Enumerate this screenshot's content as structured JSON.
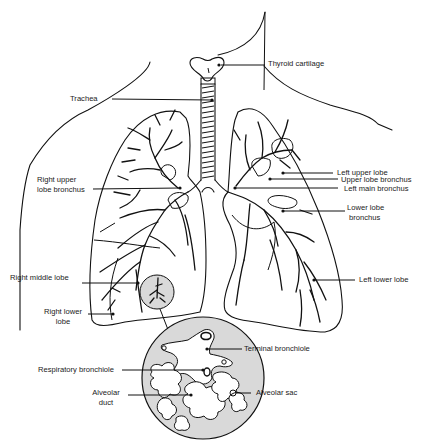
{
  "figure": {
    "type": "anatomical-line-drawing",
    "colors": {
      "ink": "#111111",
      "background": "#ffffff",
      "inset_fill": "#d9d9d9"
    }
  },
  "labels": {
    "thyroid_cartilage": "Thyroid cartilage",
    "trachea": "Trachea",
    "right_upper_lobe_bronchus_1": "Right upper",
    "right_upper_lobe_bronchus_2": "lobe bronchus",
    "left_upper_lobe": "Left upper lobe",
    "upper_lobe_bronchus": "Upper lobe bronchus",
    "left_main_bronchus": "Left main bronchus",
    "lower_lobe_bronchus_1": "Lower lobe",
    "lower_lobe_bronchus_2": "bronchus",
    "right_middle_lobe": "Right middle lobe",
    "right_lower_lobe_1": "Right lower",
    "right_lower_lobe_2": "lobe",
    "left_lower_lobe": "Left lower lobe",
    "terminal_bronchiole": "Terminal bronchiole",
    "respiratory_bronchiole": "Respiratory bronchiole",
    "alveolar_duct_1": "Alveolar",
    "alveolar_duct_2": "duct",
    "alveolar_sac": "Alveolar sac"
  }
}
